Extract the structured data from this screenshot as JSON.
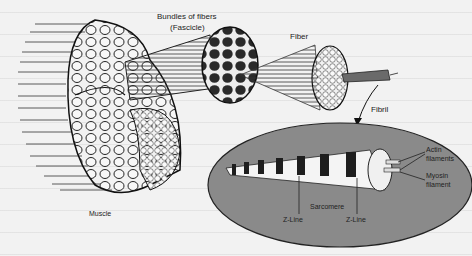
{
  "figure": {
    "labels": {
      "bundles": "Bundles of fibers",
      "fascicle": "(Fascicle)",
      "fiber": "Fiber",
      "fibril": "Fibril",
      "actin": "Actin",
      "actin2": "filaments",
      "myosin": "Myosin",
      "myosin2": "filament",
      "sarcomere": "Sarcomere",
      "zline_left": "Z-Line",
      "zline_right": "Z-Line",
      "muscle": "Muscle"
    },
    "colors": {
      "background": "#f2f2f2",
      "ellipse": "#8a8a8a",
      "ink": "#1e1e1e",
      "fascicle_fill": "#2a2a2a"
    }
  }
}
